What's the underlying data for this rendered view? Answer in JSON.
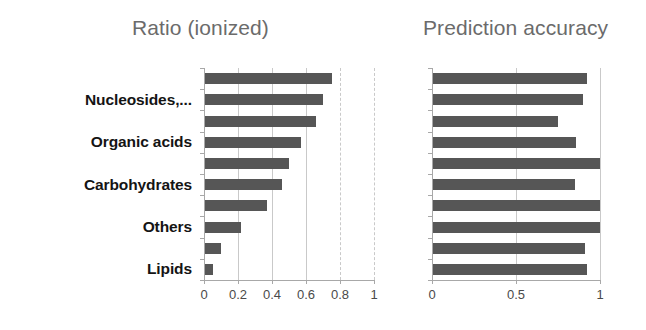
{
  "figure": {
    "background_color": "#ffffff",
    "bar_color": "#565656",
    "grid_color": "#c9c9c9",
    "axis_color": "#a8a8a8",
    "title_color": "#6b6b6b",
    "label_color": "#141414"
  },
  "left_panel": {
    "title": "Ratio (ionized)",
    "tick_labels": [
      "0",
      "0.2",
      "0.4",
      "0.6",
      "0.8",
      "1"
    ]
  },
  "right_panel": {
    "title": "Prediction accuracy",
    "tick_labels": [
      "0",
      "0.5",
      "1"
    ]
  },
  "category_labels": [
    {
      "text": "Nucleosides,...",
      "row": 1
    },
    {
      "text": "Organic acids",
      "row": 3
    },
    {
      "text": "Carbohydrates",
      "row": 5
    },
    {
      "text": "Others",
      "row": 7
    },
    {
      "text": "Lipids",
      "row": 9
    }
  ],
  "chart_data": [
    {
      "type": "bar",
      "title": "Ratio (ionized)",
      "orientation": "horizontal",
      "xlabel": "",
      "ylabel": "",
      "xlim": [
        0,
        1
      ],
      "xticks": [
        0,
        0.2,
        0.4,
        0.6,
        0.8,
        1
      ],
      "xtick_labels": [
        "0",
        "0.2",
        "0.4",
        "0.6",
        "0.8",
        "1"
      ],
      "grid": true,
      "legend": "none",
      "categories": [
        "Nucleosides,...",
        "",
        "Organic acids",
        "",
        "Carbohydrates",
        "",
        "Others",
        "",
        "Lipids",
        ""
      ],
      "values": [
        0.75,
        0.7,
        0.66,
        0.57,
        0.5,
        0.46,
        0.37,
        0.22,
        0.1,
        0.05
      ]
    },
    {
      "type": "bar",
      "title": "Prediction accuracy",
      "orientation": "horizontal",
      "xlabel": "",
      "ylabel": "",
      "xlim": [
        0,
        1
      ],
      "xticks": [
        0,
        0.5,
        1
      ],
      "xtick_labels": [
        "0",
        "0.5",
        "1"
      ],
      "grid": true,
      "legend": "none",
      "categories": [
        "Nucleosides,...",
        "",
        "Organic acids",
        "",
        "Carbohydrates",
        "",
        "Others",
        "",
        "Lipids",
        ""
      ],
      "values": [
        0.92,
        0.9,
        0.75,
        0.86,
        1.0,
        0.85,
        1.0,
        1.0,
        0.91,
        0.92
      ]
    }
  ]
}
